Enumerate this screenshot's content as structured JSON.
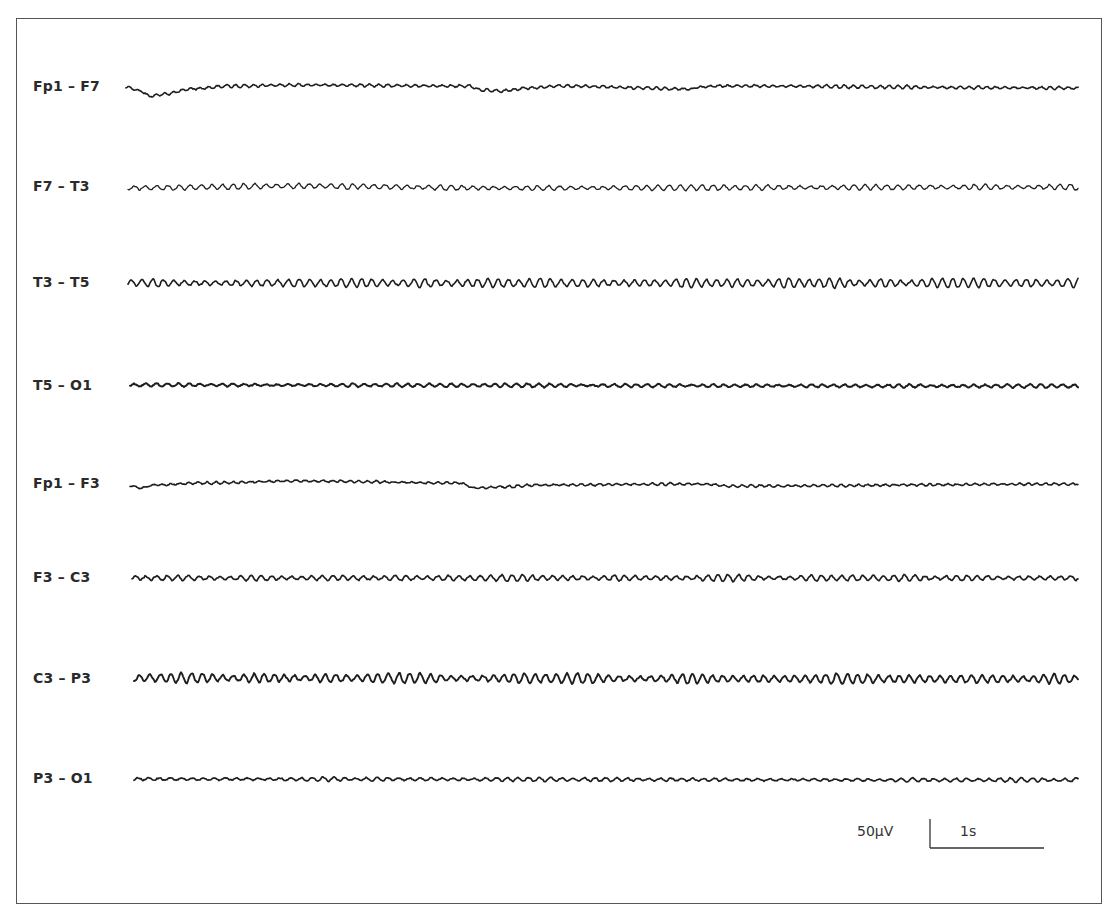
{
  "figure": {
    "type": "EEG tracing",
    "montage": "bipolar (longitudinal)",
    "frame": {
      "x": 16,
      "y": 18,
      "width": 1086,
      "height": 886,
      "border_color": "#555555"
    }
  },
  "chart_data": {
    "type": "line",
    "title": "",
    "xlabel": "",
    "ylabel": "",
    "grid": false,
    "legend": "none",
    "x_range_px": [
      130,
      1080
    ],
    "trace_color": "#1e1e1e",
    "channels": [
      {
        "label": "Fp1 – F7",
        "baseline_y": 87,
        "trace_start_x": 126,
        "amp": 1.2,
        "period": 9,
        "stroke": 1.6,
        "seed": 11,
        "drift": [
          [
            126,
            0
          ],
          [
            140,
            4
          ],
          [
            150,
            9
          ],
          [
            165,
            7
          ],
          [
            190,
            2
          ],
          [
            230,
            -1
          ],
          [
            300,
            -2
          ],
          [
            470,
            -1
          ],
          [
            480,
            3
          ],
          [
            500,
            4
          ],
          [
            530,
            1
          ],
          [
            560,
            -1
          ],
          [
            690,
            2
          ],
          [
            700,
            0
          ],
          [
            720,
            -1
          ],
          [
            1076,
            1
          ]
        ],
        "description": "low-amplitude, slow eye-movement deflections at start and ~x480"
      },
      {
        "label": "F7 – T3",
        "baseline_y": 187,
        "trace_start_x": 128,
        "amp": 2.2,
        "period": 11,
        "stroke": 1.3,
        "seed": 23,
        "drift": [
          [
            128,
            1
          ],
          [
            300,
            -1
          ],
          [
            500,
            1
          ],
          [
            1076,
            0
          ]
        ],
        "description": "alpha-range rhythmic activity, low-medium amplitude"
      },
      {
        "label": "T3 – T5",
        "baseline_y": 283,
        "trace_start_x": 128,
        "amp": 3.6,
        "period": 10.5,
        "stroke": 1.6,
        "seed": 37,
        "drift": [
          [
            128,
            0
          ],
          [
            1076,
            0
          ]
        ],
        "description": "prominent alpha rhythm, medium amplitude"
      },
      {
        "label": "T5 – O1",
        "baseline_y": 386,
        "trace_start_x": 130,
        "amp": 1.3,
        "period": 11,
        "stroke": 2.0,
        "seed": 41,
        "drift": [
          [
            130,
            -1
          ],
          [
            1076,
            0
          ]
        ],
        "description": "low amplitude, nearly flat"
      },
      {
        "label": "Fp1 – F3",
        "baseline_y": 484,
        "trace_start_x": 130,
        "amp": 1.0,
        "period": 9,
        "stroke": 1.6,
        "seed": 53,
        "drift": [
          [
            130,
            2
          ],
          [
            140,
            4
          ],
          [
            155,
            1
          ],
          [
            200,
            -1
          ],
          [
            300,
            -3
          ],
          [
            460,
            -1
          ],
          [
            475,
            4
          ],
          [
            500,
            3
          ],
          [
            540,
            1
          ],
          [
            700,
            0
          ],
          [
            730,
            2
          ],
          [
            1076,
            0
          ]
        ],
        "description": "low amplitude with slow frontal deflections"
      },
      {
        "label": "F3 – C3",
        "baseline_y": 578,
        "trace_start_x": 132,
        "amp": 2.4,
        "period": 10.5,
        "stroke": 1.7,
        "seed": 67,
        "drift": [
          [
            132,
            0
          ],
          [
            1076,
            0
          ]
        ],
        "description": "alpha-range activity, medium-low amplitude"
      },
      {
        "label": "C3 – P3",
        "baseline_y": 679,
        "trace_start_x": 134,
        "amp": 3.8,
        "period": 10.5,
        "stroke": 1.9,
        "seed": 79,
        "drift": [
          [
            134,
            -1
          ],
          [
            1076,
            0
          ]
        ],
        "description": "prominent alpha rhythm, medium amplitude"
      },
      {
        "label": "P3 – O1",
        "baseline_y": 779,
        "trace_start_x": 134,
        "amp": 1.6,
        "period": 11,
        "stroke": 1.7,
        "seed": 97,
        "drift": [
          [
            134,
            0
          ],
          [
            1076,
            1
          ]
        ],
        "description": "low amplitude irregular activity"
      }
    ],
    "scale_bar": {
      "amplitude_label": "50µV",
      "time_label": "1s",
      "vertical": {
        "x": 930,
        "y1": 819,
        "y2": 848
      },
      "horizontal": {
        "x1": 930,
        "x2": 1044,
        "y": 848
      }
    }
  }
}
